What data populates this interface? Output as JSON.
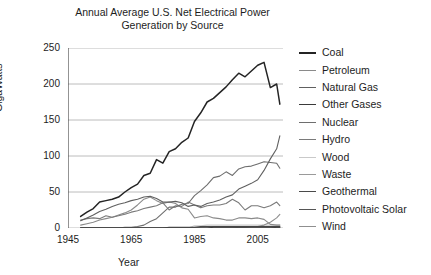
{
  "chart_data": {
    "type": "line",
    "title": "Annual Average U.S. Net Electrical Power Generation by Source",
    "title_lines": [
      "Annual Average U.S. Net Electrical Power",
      "Generation by Source"
    ],
    "xlabel": "Year",
    "ylabel": "GigaWatts",
    "xlim": [
      1945,
      2013
    ],
    "ylim": [
      0,
      250
    ],
    "xticks": [
      1945,
      1965,
      1985,
      2005
    ],
    "yticks": [
      0,
      50,
      100,
      150,
      200,
      250
    ],
    "grid": "horizontal",
    "legend_position": "right",
    "x": [
      1949,
      1951,
      1953,
      1955,
      1957,
      1959,
      1961,
      1963,
      1965,
      1967,
      1969,
      1971,
      1973,
      1975,
      1977,
      1979,
      1981,
      1983,
      1985,
      1987,
      1989,
      1991,
      1993,
      1995,
      1997,
      1999,
      2001,
      2003,
      2005,
      2007,
      2009,
      2011,
      2012
    ],
    "series": [
      {
        "name": "Coal",
        "color": "#242424",
        "values": [
          16,
          22,
          27,
          36,
          38,
          40,
          43,
          50,
          56,
          61,
          73,
          76,
          95,
          90,
          106,
          110,
          119,
          125,
          148,
          160,
          175,
          180,
          188,
          196,
          206,
          215,
          210,
          218,
          226,
          230,
          195,
          200,
          172
        ]
      },
      {
        "name": "Petroleum",
        "color": "#8a8a8a",
        "values": [
          4,
          6,
          8,
          11,
          13,
          15,
          18,
          21,
          25,
          32,
          40,
          43,
          38,
          34,
          36,
          34,
          28,
          26,
          14,
          16,
          17,
          14,
          13,
          11,
          11,
          14,
          14,
          13,
          14,
          12,
          5,
          4,
          4
        ]
      },
      {
        "name": "Natural Gas",
        "color": "#606060",
        "values": [
          10,
          14,
          18,
          23,
          26,
          30,
          33,
          35,
          38,
          40,
          43,
          44,
          41,
          36,
          36,
          37,
          35,
          30,
          32,
          30,
          34,
          36,
          39,
          43,
          46,
          54,
          58,
          62,
          67,
          80,
          96,
          110,
          128
        ]
      },
      {
        "name": "Other Gases",
        "color": "#3a3a3a",
        "values": [
          0,
          0,
          0,
          0,
          0,
          0,
          0,
          0,
          0,
          0,
          0,
          0,
          0,
          0,
          0,
          0,
          0,
          0,
          0,
          0,
          0,
          1,
          1,
          1,
          1,
          1,
          1,
          1,
          1,
          1,
          1,
          1,
          1
        ]
      },
      {
        "name": "Nuclear",
        "color": "#6e6e6e",
        "values": [
          0,
          0,
          0,
          0,
          0,
          0,
          0,
          1,
          1,
          2,
          4,
          9,
          13,
          21,
          29,
          29,
          33,
          34,
          45,
          52,
          60,
          70,
          72,
          78,
          73,
          82,
          85,
          86,
          89,
          92,
          91,
          90,
          83
        ]
      },
      {
        "name": "Hydro",
        "color": "#7a7a7a",
        "values": [
          11,
          13,
          14,
          13,
          17,
          15,
          17,
          19,
          22,
          24,
          27,
          29,
          31,
          35,
          25,
          31,
          30,
          36,
          32,
          28,
          31,
          32,
          32,
          34,
          40,
          35,
          25,
          31,
          31,
          28,
          31,
          36,
          31
        ]
      },
      {
        "name": "Wood",
        "color": "#c9c9c9",
        "values": [
          0,
          0,
          0,
          0,
          0,
          0,
          0,
          0,
          0,
          0,
          0,
          0,
          0,
          0,
          0,
          0,
          0,
          0,
          3,
          3,
          4,
          4,
          4,
          4,
          4,
          4,
          4,
          4,
          4,
          4,
          4,
          4,
          4
        ]
      },
      {
        "name": "Waste",
        "color": "#9a9a9a",
        "values": [
          0,
          0,
          0,
          0,
          0,
          0,
          0,
          0,
          0,
          0,
          0,
          0,
          0,
          0,
          0,
          0,
          0,
          0,
          0,
          1,
          2,
          2,
          2,
          2,
          2,
          2,
          2,
          2,
          2,
          2,
          2,
          2,
          2
        ]
      },
      {
        "name": "Geothermal",
        "color": "#4a4a4a",
        "values": [
          0,
          0,
          0,
          0,
          0,
          0,
          0,
          0,
          0,
          0,
          0,
          0,
          0,
          0,
          1,
          1,
          1,
          1,
          1,
          2,
          2,
          2,
          2,
          2,
          2,
          2,
          2,
          2,
          2,
          2,
          2,
          2,
          2
        ]
      },
      {
        "name": "Photovoltaic Solar",
        "color": "#555555",
        "values": [
          0,
          0,
          0,
          0,
          0,
          0,
          0,
          0,
          0,
          0,
          0,
          0,
          0,
          0,
          0,
          0,
          0,
          0,
          0,
          0,
          0,
          0,
          0,
          0,
          0,
          0,
          0,
          0,
          0,
          0,
          0,
          1,
          1
        ]
      },
      {
        "name": "Wind",
        "color": "#8f8f8f",
        "values": [
          0,
          0,
          0,
          0,
          0,
          0,
          0,
          0,
          0,
          0,
          0,
          0,
          0,
          0,
          0,
          0,
          0,
          0,
          0,
          0,
          0,
          0,
          0,
          0,
          0,
          1,
          1,
          2,
          2,
          4,
          8,
          14,
          19
        ]
      }
    ]
  },
  "axis": {
    "ytick_labels": [
      "250",
      "200",
      "150",
      "100",
      "50",
      "0"
    ],
    "xtick_labels": [
      "1945",
      "1965",
      "1985",
      "2005"
    ],
    "ylabel": "GigaWatts",
    "xlabel": "Year"
  },
  "title": {
    "line1": "Annual Average U.S. Net Electrical Power",
    "line2": "Generation by Source"
  },
  "legend": {
    "items": [
      {
        "label": "Coal",
        "color": "#242424"
      },
      {
        "label": "Petroleum",
        "color": "#8a8a8a"
      },
      {
        "label": "Natural Gas",
        "color": "#606060"
      },
      {
        "label": "Other Gases",
        "color": "#3a3a3a"
      },
      {
        "label": "Nuclear",
        "color": "#6e6e6e"
      },
      {
        "label": "Hydro",
        "color": "#7a7a7a"
      },
      {
        "label": "Wood",
        "color": "#c9c9c9"
      },
      {
        "label": "Waste",
        "color": "#9a9a9a"
      },
      {
        "label": "Geothermal",
        "color": "#4a4a4a"
      },
      {
        "label": "Photovoltaic Solar",
        "color": "#555555"
      },
      {
        "label": "Wind",
        "color": "#8f8f8f"
      }
    ]
  }
}
